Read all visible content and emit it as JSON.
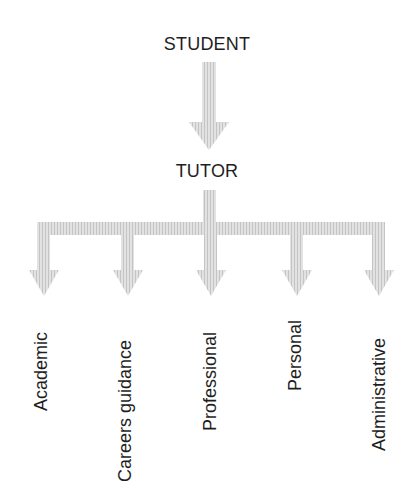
{
  "diagram": {
    "type": "hierarchy",
    "root": {
      "label": "STUDENT"
    },
    "middle": {
      "label": "TUTOR"
    },
    "branches": [
      {
        "label": "Academic"
      },
      {
        "label": "Careers guidance"
      },
      {
        "label": "Professional"
      },
      {
        "label": "Personal"
      },
      {
        "label": "Administrative"
      }
    ],
    "edges": [
      {
        "from": "STUDENT",
        "to": "TUTOR"
      },
      {
        "from": "TUTOR",
        "to": "Academic"
      },
      {
        "from": "TUTOR",
        "to": "Careers guidance"
      },
      {
        "from": "TUTOR",
        "to": "Professional"
      },
      {
        "from": "TUTOR",
        "to": "Personal"
      },
      {
        "from": "TUTOR",
        "to": "Administrative"
      }
    ],
    "colors": {
      "arrow_fill": "#d8d8d8",
      "arrow_hatch": "#bcbcbc",
      "text": "#1e1e1e"
    }
  }
}
